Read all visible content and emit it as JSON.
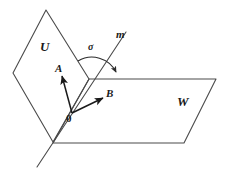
{
  "figure": {
    "type": "geometry-diagram",
    "background_color": "#ffffff",
    "stroke_color": "#4a4a4a",
    "vector_color": "#1a1a1a",
    "label_color": "#1a1a1a"
  },
  "labels": {
    "plane_u": "U",
    "plane_w": "W",
    "line_m": "m",
    "angle_sigma": "σ",
    "vector_a": "A",
    "vector_b": "B",
    "origin": "0"
  },
  "geometry": {
    "plane_u": {
      "name": "plane-u",
      "shape": "rhombus",
      "points": "46,10 13,73 53,142 89,79"
    },
    "plane_w": {
      "name": "plane-w",
      "shape": "parallelogram",
      "points": "89,79 216,79 184,143 53,143"
    },
    "line_m": {
      "name": "line-m",
      "x1": 126,
      "y1": 32,
      "x2": 37,
      "y2": 167
    },
    "vector_a": {
      "name": "vector-a",
      "x1": 72,
      "y1": 113,
      "x2": 62,
      "y2": 76
    },
    "vector_b": {
      "name": "vector-b",
      "x1": 72,
      "y1": 113,
      "x2": 103,
      "y2": 98
    },
    "angle_arc": {
      "name": "angle-arc-sigma",
      "path": "M 78 61 A 27 27 0 0 1 116 72"
    }
  },
  "label_positions": {
    "plane_u": {
      "left": 40,
      "top": 40
    },
    "plane_w": {
      "left": 177,
      "top": 95
    },
    "line_m": {
      "left": 116,
      "top": 29
    },
    "angle_sigma": {
      "left": 88,
      "top": 42
    },
    "vector_a": {
      "left": 55,
      "top": 63
    },
    "vector_b": {
      "left": 106,
      "top": 88
    },
    "origin": {
      "left": 66,
      "top": 113
    }
  }
}
